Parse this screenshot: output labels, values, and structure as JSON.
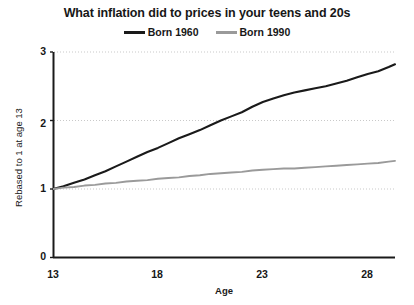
{
  "chart_data": {
    "type": "line",
    "title": "What inflation did to prices in your teens and 20s",
    "xlabel": "Age",
    "ylabel": "Rebased to 1 at age 13",
    "xlim": [
      13,
      29.3
    ],
    "ylim": [
      0,
      3
    ],
    "grid": "horizontal-dotted",
    "legend_position": "top-center",
    "xticks": [
      "13",
      "18",
      "23",
      "28"
    ],
    "xtick_values": [
      13,
      18,
      23,
      28
    ],
    "yticks": [
      "0",
      "1",
      "2",
      "3"
    ],
    "ytick_values": [
      0,
      1,
      2,
      3
    ],
    "colors": {
      "born_1960": "#1a1a1a",
      "born_1990": "#9a9a9a",
      "axis": "#1a1a1a",
      "grid": "#c9c9c9",
      "background": "#ffffff"
    },
    "x": [
      13,
      13.5,
      14,
      14.5,
      15,
      15.5,
      16,
      16.5,
      17,
      17.5,
      18,
      18.5,
      19,
      19.5,
      20,
      20.5,
      21,
      21.5,
      22,
      22.5,
      23,
      23.5,
      24,
      24.5,
      25,
      25.5,
      26,
      26.5,
      27,
      27.5,
      28,
      28.5,
      29,
      29.3
    ],
    "series": [
      {
        "name": "Born 1960",
        "color": "#1a1a1a",
        "values": [
          1.0,
          1.04,
          1.09,
          1.14,
          1.2,
          1.26,
          1.33,
          1.4,
          1.47,
          1.54,
          1.6,
          1.67,
          1.74,
          1.8,
          1.86,
          1.93,
          2.0,
          2.06,
          2.12,
          2.2,
          2.27,
          2.32,
          2.37,
          2.41,
          2.44,
          2.47,
          2.5,
          2.54,
          2.58,
          2.63,
          2.68,
          2.72,
          2.78,
          2.82
        ]
      },
      {
        "name": "Born 1990",
        "color": "#9a9a9a",
        "values": [
          1.0,
          1.02,
          1.03,
          1.05,
          1.06,
          1.08,
          1.09,
          1.11,
          1.12,
          1.13,
          1.15,
          1.16,
          1.17,
          1.19,
          1.2,
          1.22,
          1.23,
          1.24,
          1.25,
          1.27,
          1.28,
          1.29,
          1.3,
          1.3,
          1.31,
          1.32,
          1.33,
          1.34,
          1.35,
          1.36,
          1.37,
          1.38,
          1.4,
          1.41
        ]
      }
    ]
  }
}
